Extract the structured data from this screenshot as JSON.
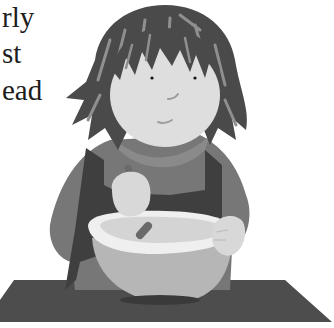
{
  "page": {
    "text_lines": [
      "rly",
      "st",
      "ead"
    ]
  },
  "illustration": {
    "subject": "child stirring a mixing bowl on a placemat",
    "palette": {
      "background": "#ffffff",
      "hair": "#4a4a4a",
      "hair_highlight": "#8f8f8f",
      "face": "#dedede",
      "sweater": "#777777",
      "apron": "#3f3f3f",
      "bowl_rim": "#efefef",
      "bowl_body": "#b6b6b6",
      "bowl_inside": "#d4d4d4",
      "spoon": "#6a6a6a",
      "hands": "#d8d8d8",
      "placemat": "#4d4d4d",
      "text": "#1d1d1d"
    }
  }
}
